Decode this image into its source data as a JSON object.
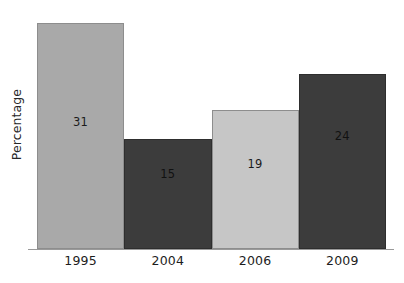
{
  "chart_data": {
    "type": "bar",
    "title": "",
    "xlabel": "",
    "ylabel": "Percentage",
    "categories": [
      "1995",
      "2004",
      "2006",
      "2009"
    ],
    "values": [
      31,
      15,
      19,
      24
    ],
    "value_labels": [
      "31",
      "15",
      "19",
      "24"
    ],
    "ylim": [
      0,
      33
    ],
    "grid": false,
    "legend": null,
    "bar_colors": [
      "#a9a9a9",
      "#3c3c3c",
      "#c6c6c6",
      "#3c3c3c"
    ],
    "series": [
      {
        "name": "Percentage",
        "values": [
          31,
          15,
          19,
          24
        ]
      }
    ],
    "points": [
      {
        "category": "1995",
        "value": 31,
        "label": "31",
        "color": "#a9a9a9",
        "shade": "light"
      },
      {
        "category": "2004",
        "value": 15,
        "label": "15",
        "color": "#3c3c3c",
        "shade": "dark"
      },
      {
        "category": "2006",
        "value": 19,
        "label": "19",
        "color": "#c6c6c6",
        "shade": "light"
      },
      {
        "category": "2009",
        "value": 24,
        "label": "24",
        "color": "#3c3c3c",
        "shade": "dark"
      }
    ]
  },
  "axis": {
    "y_title": "Percentage",
    "x_ticks": [
      "1995",
      "2004",
      "2006",
      "2009"
    ]
  },
  "colors": {
    "background": "#ffffff",
    "axis_line": "#9a9a9a",
    "text": "#1d1d1d",
    "bar_light_1": "#a9a9a9",
    "bar_light_2": "#c6c6c6",
    "bar_dark": "#3c3c3c",
    "bar_border_light": "#8d8d8d",
    "bar_border_dark": "#2e2e2e"
  }
}
